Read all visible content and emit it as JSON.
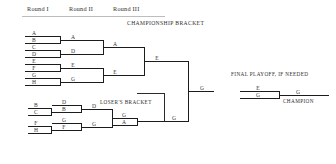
{
  "header": {
    "rounds": [
      {
        "label": "Round I"
      },
      {
        "label": "Round II"
      },
      {
        "label": "Round III"
      }
    ]
  },
  "sections": {
    "championship_title": "CHAMPIONSHIP BRACKET",
    "losers_title": "LOSER'S BRACKET",
    "final_playoff_title": "FINAL PLAYOFF, IF NEEDED",
    "champion_label": "CHAMPION"
  },
  "championship_bracket": {
    "round1": [
      {
        "slot": "A"
      },
      {
        "slot": "B"
      },
      {
        "slot": "C"
      },
      {
        "slot": "D"
      },
      {
        "slot": "E"
      },
      {
        "slot": "F"
      },
      {
        "slot": "G"
      },
      {
        "slot": "H"
      }
    ],
    "round2": [
      {
        "slot": "A"
      },
      {
        "slot": "D"
      },
      {
        "slot": "E"
      },
      {
        "slot": "G"
      }
    ],
    "round3": [
      {
        "slot": "A"
      },
      {
        "slot": "E"
      }
    ],
    "round4": [
      {
        "slot": "E"
      }
    ]
  },
  "losers_bracket": {
    "round1": [
      {
        "slot": "B"
      },
      {
        "slot": "C"
      },
      {
        "slot": "F"
      },
      {
        "slot": "H"
      }
    ],
    "round2": [
      {
        "slot": "D"
      },
      {
        "slot": "B"
      },
      {
        "slot": "G"
      },
      {
        "slot": "F"
      }
    ],
    "round3": [
      {
        "slot": "D"
      },
      {
        "slot": "G"
      }
    ],
    "round4": [
      {
        "slot": "G"
      },
      {
        "slot": "A"
      }
    ],
    "winner": {
      "slot": "G"
    }
  },
  "grand_final": {
    "entrant_top": "G",
    "entrant_bottom": "A"
  },
  "final_playoff": {
    "entrant_top": "E",
    "entrant_bottom": "G",
    "winner": "G"
  },
  "colors": {
    "stroke": "#1c1c1c",
    "text": "#2e2e2e",
    "rule": "#bdbdbd",
    "background": "#ffffff"
  }
}
